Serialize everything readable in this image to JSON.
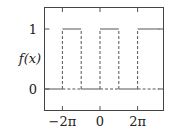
{
  "chart_data": {
    "type": "line",
    "title": "",
    "xlabel": "",
    "ylabel": "f(x)",
    "xlim": [
      -9.9,
      9.9
    ],
    "ylim": [
      -0.35,
      1.2
    ],
    "grid": false,
    "legend": null,
    "x_ticks": [
      {
        "value": -6.2832,
        "label": "−2π"
      },
      {
        "value": 0,
        "label": "0"
      },
      {
        "value": 6.2832,
        "label": "2π"
      }
    ],
    "y_ticks": [
      {
        "value": 0,
        "label": "0"
      },
      {
        "value": 1,
        "label": "1"
      }
    ],
    "series": [
      {
        "name": "f(x) square wave",
        "description": "f(x)=1 on [2kπ, 2kπ+π], 0 otherwise; jumps drawn as dashed verticals, baseline dashed under high segments",
        "segments": [
          {
            "x": [
              -9.9,
              -6.2832
            ],
            "y": 0
          },
          {
            "x": [
              -6.2832,
              -3.1416
            ],
            "y": 1
          },
          {
            "x": [
              -3.1416,
              0
            ],
            "y": 0
          },
          {
            "x": [
              0,
              3.1416
            ],
            "y": 1
          },
          {
            "x": [
              3.1416,
              6.2832
            ],
            "y": 0
          },
          {
            "x": [
              6.2832,
              9.9
            ],
            "y": 1
          }
        ]
      }
    ],
    "colors": {
      "line": "#555555",
      "frame": "#444444"
    }
  }
}
